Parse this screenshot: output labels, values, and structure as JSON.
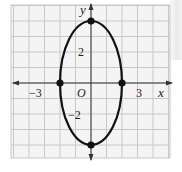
{
  "chart_data": {
    "type": "line",
    "title": "",
    "equation": "x^2/4 + y^2/16 = 1",
    "xlabel": "x",
    "ylabel": "y",
    "origin_label": "O",
    "xlim": [
      -5,
      5
    ],
    "ylim": [
      -5,
      5
    ],
    "grid": true,
    "tick_labels": {
      "x": [
        {
          "value": -3,
          "label": "−3"
        },
        {
          "value": 3,
          "label": "3"
        }
      ],
      "y": [
        {
          "value": 2,
          "label": "2"
        },
        {
          "value": -2,
          "label": "−2"
        }
      ]
    },
    "series": [
      {
        "name": "ellipse",
        "center": [
          0,
          0
        ],
        "semi_axis_x": 2,
        "semi_axis_y": 4,
        "points": [
          [
            -2,
            0
          ],
          [
            2,
            0
          ],
          [
            0,
            4
          ],
          [
            0,
            -4
          ]
        ]
      }
    ],
    "colors": {
      "curve": "#111111",
      "grid": "#c8c8c8",
      "axis": "#333333",
      "background": "#f4f4f4"
    }
  },
  "labels": {
    "x_axis": "x",
    "y_axis": "y",
    "origin": "O",
    "x_neg3": "−3",
    "x_pos3": "3",
    "y_pos2": "2",
    "y_neg2": "−2"
  }
}
